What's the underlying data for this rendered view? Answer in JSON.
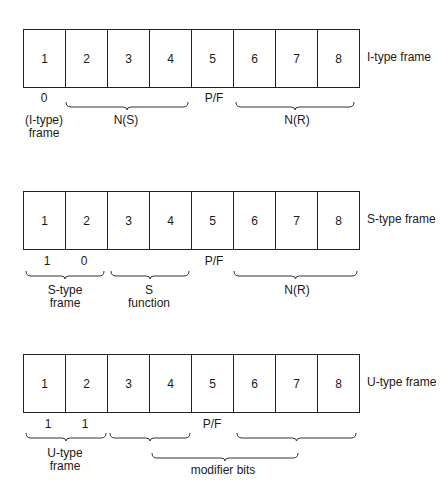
{
  "frames": [
    {
      "id": "i",
      "title": "I-type frame",
      "cells": [
        "1",
        "2",
        "3",
        "4",
        "5",
        "6",
        "7",
        "8"
      ],
      "bit_values": [
        {
          "text": "0",
          "x": 44
        },
        {
          "text": "P/F",
          "x": 214
        }
      ],
      "labels": [
        {
          "text": "(I-type)",
          "x": 44,
          "y": 114
        },
        {
          "text": "frame",
          "x": 44,
          "y": 127
        },
        {
          "text": "N(S)",
          "x": 126,
          "y": 114
        },
        {
          "text": "N(R)",
          "x": 297,
          "y": 114
        }
      ]
    },
    {
      "id": "s",
      "title": "S-type frame",
      "cells": [
        "1",
        "2",
        "3",
        "4",
        "5",
        "6",
        "7",
        "8"
      ],
      "bit_values": [
        {
          "text": "1",
          "x": 47
        },
        {
          "text": "0",
          "x": 84
        },
        {
          "text": "P/F",
          "x": 214
        }
      ],
      "labels": [
        {
          "text": "S-type",
          "x": 65,
          "y": 284
        },
        {
          "text": "frame",
          "x": 65,
          "y": 297
        },
        {
          "text": "S",
          "x": 149,
          "y": 284
        },
        {
          "text": "function",
          "x": 149,
          "y": 297
        },
        {
          "text": "N(R)",
          "x": 297,
          "y": 284
        }
      ]
    },
    {
      "id": "u",
      "title": "U-type frame",
      "cells": [
        "1",
        "2",
        "3",
        "4",
        "5",
        "6",
        "7",
        "8"
      ],
      "bit_values": [
        {
          "text": "1",
          "x": 48
        },
        {
          "text": "1",
          "x": 85
        },
        {
          "text": "P/F",
          "x": 212
        }
      ],
      "labels": [
        {
          "text": "U-type",
          "x": 65,
          "y": 447
        },
        {
          "text": "frame",
          "x": 65,
          "y": 460
        },
        {
          "text": "modifier bits",
          "x": 223,
          "y": 462
        }
      ]
    }
  ],
  "braces": [
    {
      "frame": "i",
      "x1": 66,
      "x2": 188,
      "y": 102,
      "label": "N(S)"
    },
    {
      "frame": "i",
      "x1": 236,
      "x2": 354,
      "y": 102,
      "label": "N(R)"
    },
    {
      "frame": "s",
      "x1": 26,
      "x2": 104,
      "y": 271,
      "label": "S-type frame"
    },
    {
      "frame": "s",
      "x1": 111,
      "x2": 189,
      "y": 271,
      "label": "S function"
    },
    {
      "frame": "s",
      "x1": 234,
      "x2": 357,
      "y": 271,
      "label": "N(R)"
    },
    {
      "frame": "u",
      "x1": 26,
      "x2": 106,
      "y": 433,
      "label": "U-type frame"
    },
    {
      "frame": "u",
      "x1": 110,
      "x2": 190,
      "y": 433,
      "label": "bits 3-4"
    },
    {
      "frame": "u",
      "x1": 237,
      "x2": 356,
      "y": 433,
      "label": "bits 6-8"
    },
    {
      "frame": "u",
      "x1": 152,
      "x2": 298,
      "y": 453,
      "label": "modifier bits"
    }
  ]
}
